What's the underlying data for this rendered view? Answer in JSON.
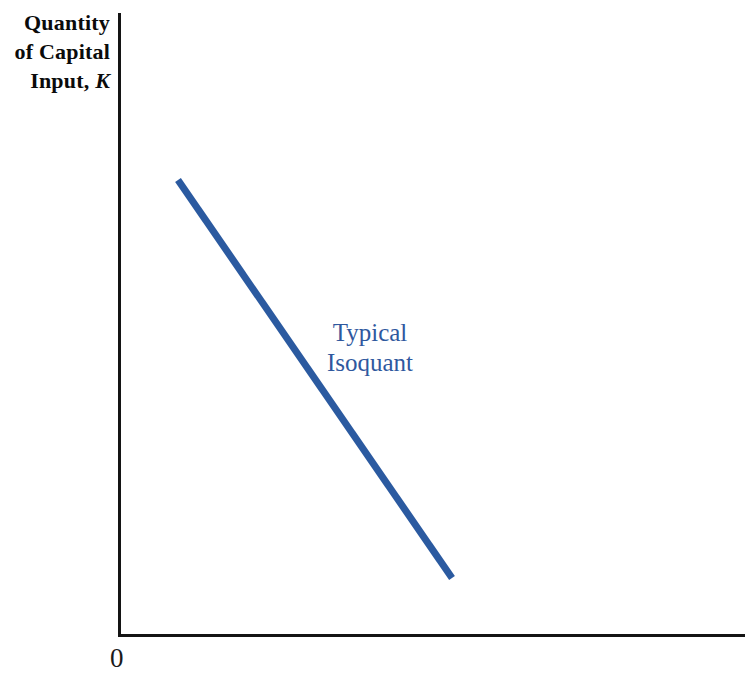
{
  "figure": {
    "background": "#ffffff",
    "width": 745,
    "height": 681
  },
  "axes": {
    "y_title_line1": "Quantity",
    "y_title_line2": "of Capital",
    "y_title_line3_prefix": "Input, ",
    "y_title_line3_symbol": "K",
    "origin_label": "0",
    "axis_color": "#141414"
  },
  "annotations": {
    "isoquant_label": "Typical\nIsoquant",
    "isoquant_label_color": "#2f589e"
  },
  "chart_data": {
    "type": "line",
    "title": "",
    "subtitle": "",
    "xlabel": "",
    "ylabel": "Quantity of Capital Input, K",
    "xlim": [
      0,
      1
    ],
    "ylim": [
      0,
      1
    ],
    "grid": false,
    "legend": "none",
    "origin_label": "0",
    "series": [
      {
        "name": "Typical Isoquant",
        "color": "#2b5aa0",
        "linewidth": 7,
        "style": "straight-segment",
        "annotation": "Typical Isoquant",
        "x": [
          0.095,
          0.533
        ],
        "y": [
          0.732,
          0.093
        ],
        "pixel_points": [
          [
            178,
            180
          ],
          [
            452,
            578
          ]
        ],
        "description": "Downward sloping straight isoquant showing constant output with capital-labor substitution"
      }
    ],
    "axis_ticks": {
      "x": [],
      "y": []
    }
  }
}
